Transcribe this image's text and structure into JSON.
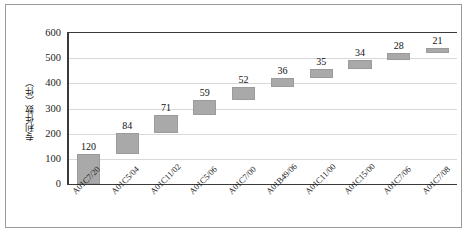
{
  "chart_data": {
    "type": "bar",
    "subtype": "waterfall-cumulative",
    "title": "",
    "xlabel": "",
    "ylabel": "专利件数（件）",
    "ylim": [
      0,
      600
    ],
    "ytick_step": 100,
    "ytick_labels": [
      "600",
      "500",
      "400",
      "300",
      "200",
      "100",
      "0"
    ],
    "ytick_values": [
      600,
      500,
      400,
      300,
      200,
      100,
      0
    ],
    "grid": true,
    "grid_axis": "y",
    "legend": false,
    "categories": [
      "A01C7/20",
      "A01C5/04",
      "A01C11/02",
      "A01C5/06",
      "A01C7/00",
      "A01B49/06",
      "A01C11/00",
      "A01C15/00",
      "A01C7/06",
      "A01C7/08"
    ],
    "values": [
      120,
      84,
      71,
      59,
      52,
      36,
      35,
      34,
      28,
      21
    ],
    "data_labels": [
      "120",
      "84",
      "71",
      "59",
      "52",
      "36",
      "35",
      "34",
      "28",
      "21"
    ],
    "cumulative_base": [
      0,
      120,
      204,
      275,
      334,
      386,
      422,
      457,
      491,
      519
    ],
    "cumulative_top": [
      120,
      204,
      275,
      334,
      386,
      422,
      457,
      491,
      519,
      540
    ],
    "bar_color": "#a9a9a9",
    "bar_edge_color": "#9b9b9b",
    "gridline_color": "#d9d9d9",
    "axis_color": "#3a3a3a",
    "frame_border_color": "#9a9a9a",
    "text_color": "#1d1d1d"
  }
}
